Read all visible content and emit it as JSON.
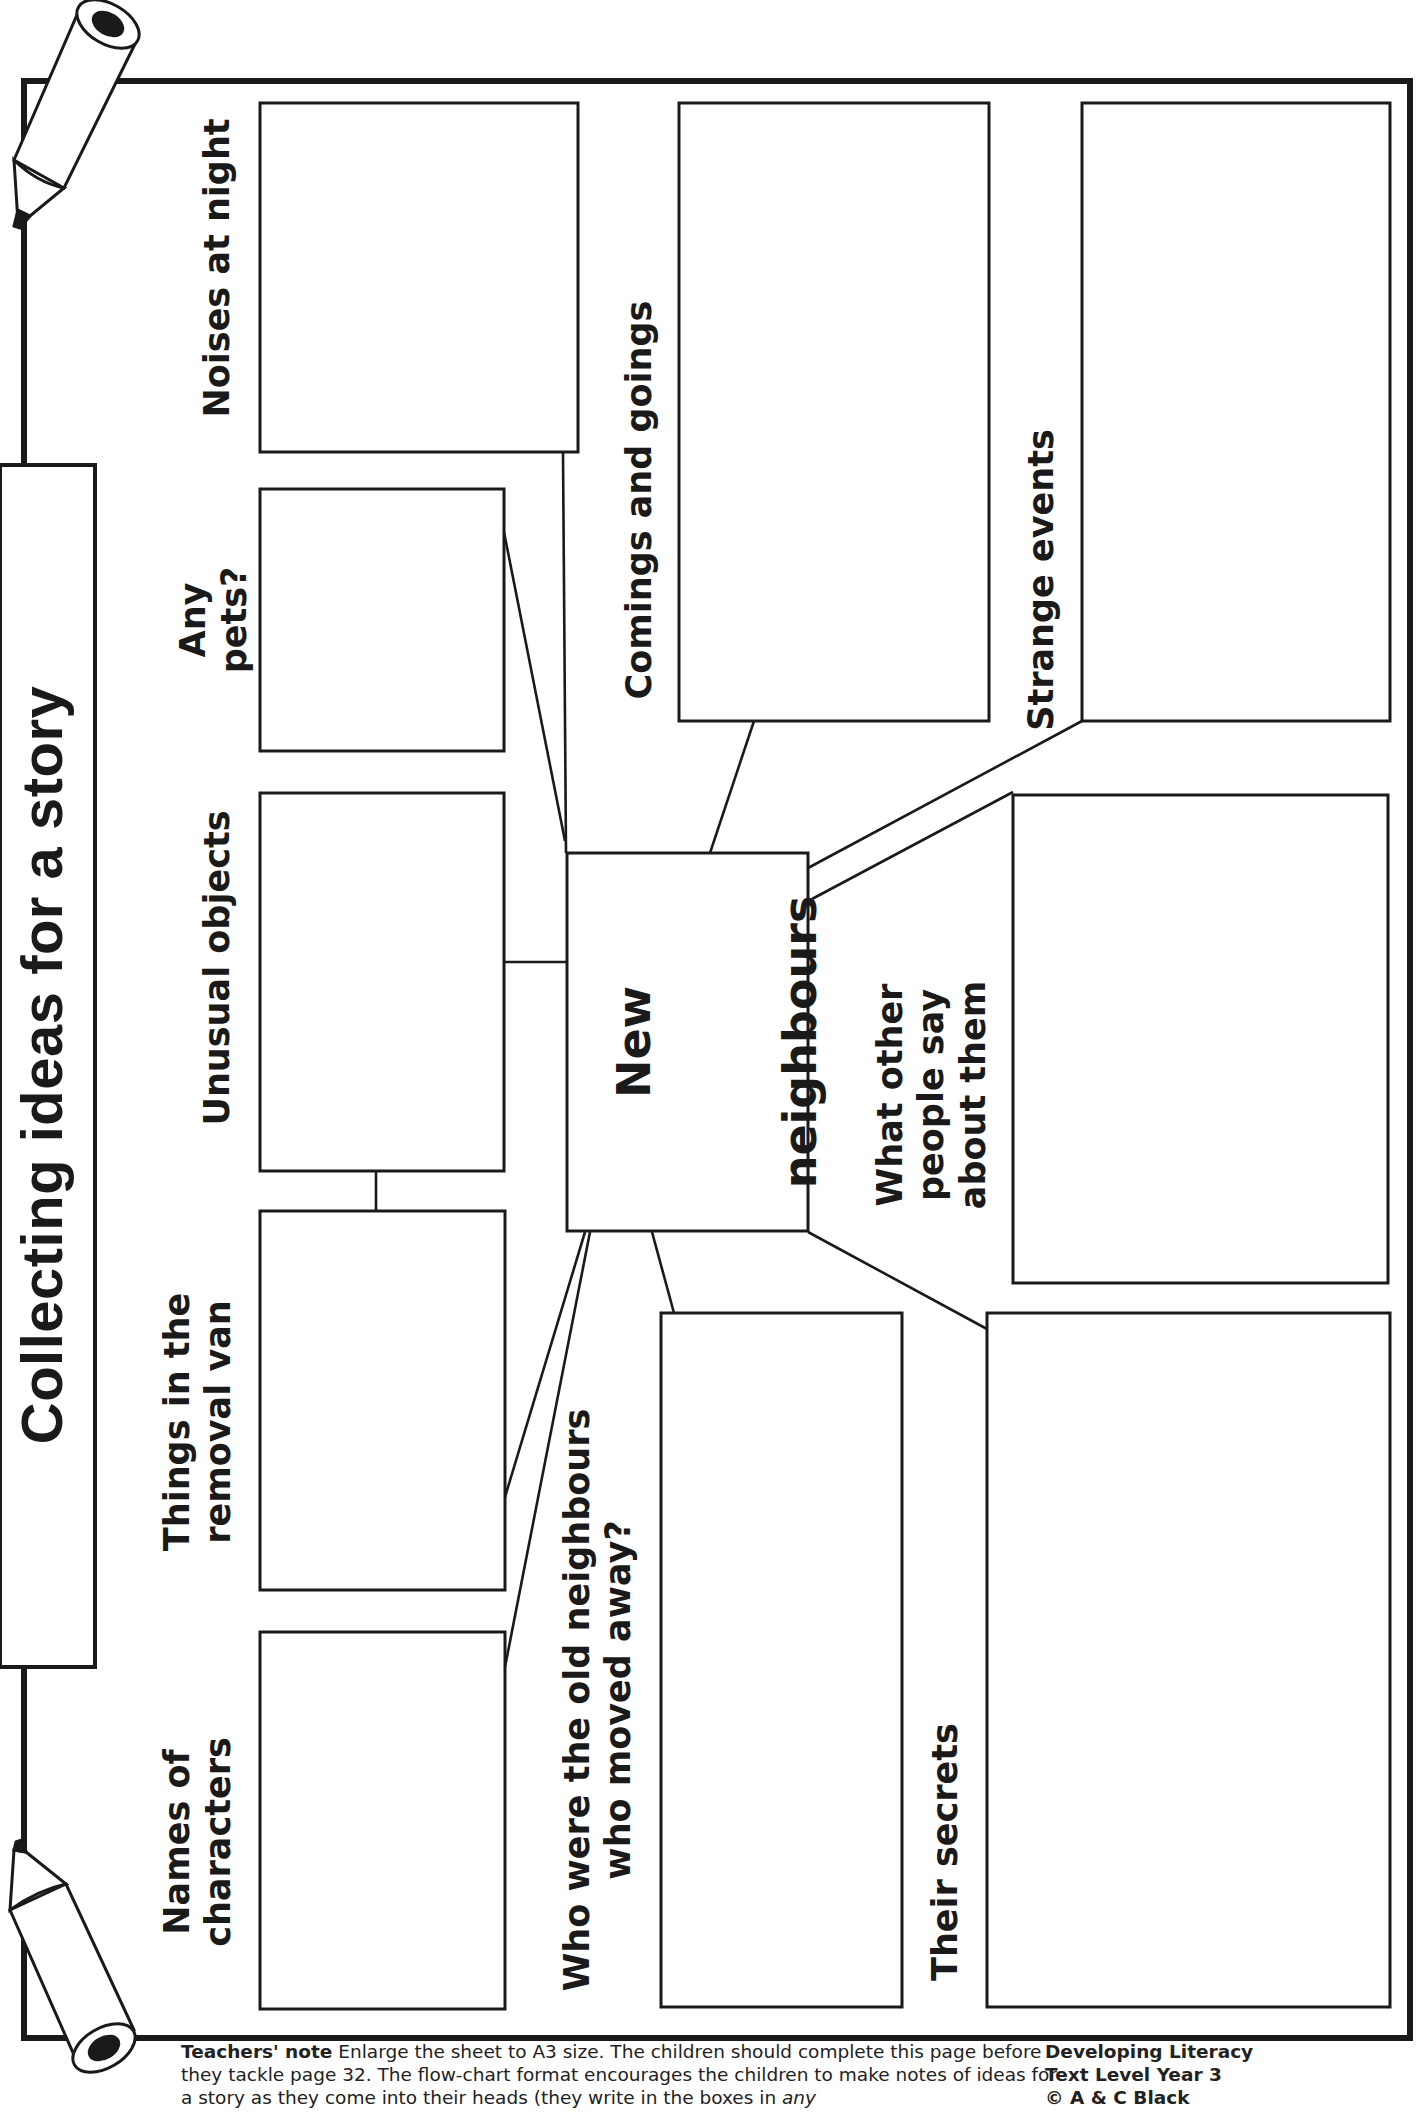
{
  "title": "Collecting ideas for a story",
  "center": {
    "line1": "New",
    "line2": "neighbours"
  },
  "boxes": [
    {
      "id": "noises-at-night",
      "label": "Noises at night"
    },
    {
      "id": "any-pets",
      "label": "Any\npets?"
    },
    {
      "id": "unusual-objects",
      "label": "Unusual objects"
    },
    {
      "id": "things-in-van",
      "label": "Things in the\nremoval van"
    },
    {
      "id": "names-of-characters",
      "label": "Names of\ncharacters"
    },
    {
      "id": "comings-and-goings",
      "label": "Comings and goings"
    },
    {
      "id": "strange-events",
      "label": "Strange events"
    },
    {
      "id": "what-others-say",
      "label": "What other\npeople say\nabout them"
    },
    {
      "id": "old-neighbours",
      "label": "Who were the old neighbours\nwho moved away?"
    },
    {
      "id": "their-secrets",
      "label": "Their secrets"
    }
  ],
  "teachers_note": {
    "heading": "Teachers' note",
    "text": "Enlarge the sheet to A3 size. The children should complete this page before they tackle page 32. The flow-chart format encourages the children to make notes of ideas for a story as they come into their heads (they write in the boxes in",
    "emphasis": "any"
  },
  "credit": {
    "line1": "Developing Literacy",
    "line2": "Text Level Year 3",
    "line3": "© A & C Black"
  },
  "colors": {
    "ink": "#1a1a1a",
    "paper": "#ffffff"
  }
}
